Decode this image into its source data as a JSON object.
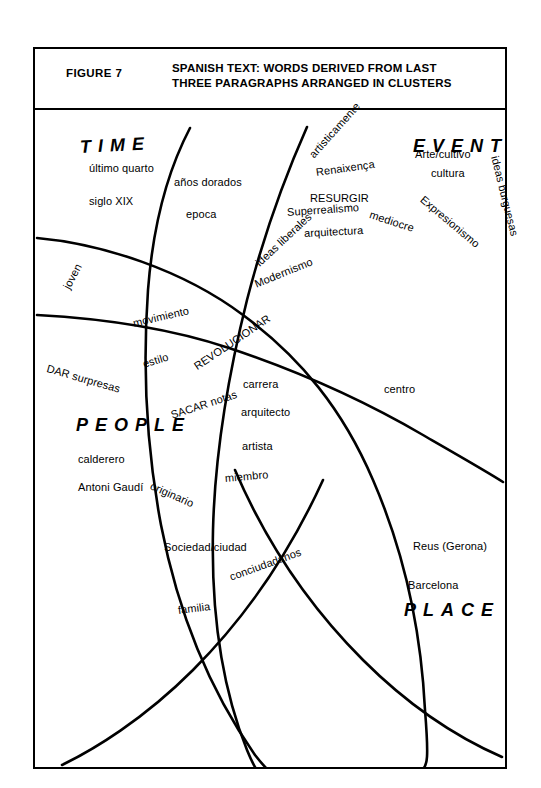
{
  "header": {
    "figure_label": "FIGURE 7",
    "title_line1": "SPANISH TEXT: WORDS DERIVED FROM LAST",
    "title_line2": "THREE PARAGRAPHS ARRANGED IN CLUSTERS",
    "title": "SPANISH TEXT: WORDS DERIVED FROM LAST\nTHREE PARAGRAPHS ARRANGED IN CLUSTERS"
  },
  "colors": {
    "ink": "#000000",
    "paper": "#ffffff"
  },
  "chart_data": {
    "type": "diagram",
    "title": "SPANISH TEXT: WORDS DERIVED FROM LAST THREE PARAGRAPHS ARRANGED IN CLUSTERS",
    "diagram_kind": "overlapping-cluster-venn",
    "cluster_names": [
      "TIME",
      "EVENT",
      "PEOPLE",
      "PLACE"
    ],
    "clusters": [
      {
        "name": "TIME",
        "words": [
          "último quarto",
          "siglo XIX",
          "años dorados",
          "epoca",
          "joven"
        ]
      },
      {
        "name": "EVENT",
        "words": [
          "artisticamente",
          "Renaixença",
          "Arte/cultivo",
          "cultura",
          "RESURGIR",
          "Superrealismo",
          "arquitectura",
          "Expresionismo",
          "mediocre",
          "ideas burguesas",
          "ideas liberales",
          "Modernismo"
        ]
      },
      {
        "name": "PEOPLE",
        "words": [
          "DAR surpresas",
          "calderero",
          "Antoni Gaudí",
          "movimiento",
          "estilo",
          "originario",
          "artista",
          "miembro"
        ]
      },
      {
        "name": "PLACE",
        "words": [
          "Sociedad/ciudad",
          "conciudadanos",
          "familia",
          "Reus (Gerona)",
          "Barcelona",
          "centro"
        ]
      },
      {
        "name": "overlap-center",
        "words": [
          "REVOLUCIONAR",
          "SACAR notas",
          "carrera",
          "arquitecto"
        ]
      }
    ]
  },
  "cluster_labels": [
    {
      "text": "TIME",
      "x": 47,
      "y": 27,
      "rot": -3,
      "size": 18,
      "spacing": 7
    },
    {
      "text": "EVENT",
      "x": 380,
      "y": 26,
      "rot": 0,
      "size": 18,
      "spacing": 7
    },
    {
      "text": "PEOPLE",
      "x": 43,
      "y": 305,
      "rot": 0,
      "size": 18,
      "spacing": 7
    },
    {
      "text": "PLACE",
      "x": 371,
      "y": 490,
      "rot": 0,
      "size": 18,
      "spacing": 7
    }
  ],
  "words": [
    {
      "text": "último quarto",
      "x": 56,
      "y": 52,
      "rot": 0
    },
    {
      "text": "siglo XIX",
      "x": 56,
      "y": 85,
      "rot": 0
    },
    {
      "text": "años dorados",
      "x": 141,
      "y": 66,
      "rot": 0
    },
    {
      "text": "epoca",
      "x": 153,
      "y": 98,
      "rot": 0
    },
    {
      "text": "joven",
      "x": 33,
      "y": 172,
      "rot": -62
    },
    {
      "text": "artisticamente",
      "x": 278,
      "y": 40,
      "rot": -48
    },
    {
      "text": "Renaixença",
      "x": 283,
      "y": 56,
      "rot": -8
    },
    {
      "text": "Arte/cultivo",
      "x": 382,
      "y": 38,
      "rot": 0
    },
    {
      "text": "cultura",
      "x": 398,
      "y": 57,
      "rot": 0
    },
    {
      "text": "RESURGIR",
      "x": 277,
      "y": 82,
      "rot": 0
    },
    {
      "text": "Superrealismo",
      "x": 254,
      "y": 96,
      "rot": -4
    },
    {
      "text": "arquitectura",
      "x": 271,
      "y": 117,
      "rot": -3
    },
    {
      "text": "Expresionismo",
      "x": 389,
      "y": 82,
      "rot": 40
    },
    {
      "text": "mediocre",
      "x": 337,
      "y": 98,
      "rot": 18
    },
    {
      "text": "ideas burguesas",
      "x": 462,
      "y": 40,
      "rot": 76
    },
    {
      "text": "ideas liberales",
      "x": 224,
      "y": 148,
      "rot": -43
    },
    {
      "text": "Modernismo",
      "x": 222,
      "y": 168,
      "rot": -22
    },
    {
      "text": "movimiento",
      "x": 100,
      "y": 207,
      "rot": -13
    },
    {
      "text": "estilo",
      "x": 110,
      "y": 248,
      "rot": -17
    },
    {
      "text": "DAR surpresas",
      "x": 14,
      "y": 252,
      "rot": 16
    },
    {
      "text": "REVOLUCIONAR",
      "x": 162,
      "y": 251,
      "rot": -34
    },
    {
      "text": "carrera",
      "x": 210,
      "y": 268,
      "rot": 0
    },
    {
      "text": "SACAR notas",
      "x": 138,
      "y": 299,
      "rot": -18
    },
    {
      "text": "arquitecto",
      "x": 208,
      "y": 296,
      "rot": 0
    },
    {
      "text": "artista",
      "x": 209,
      "y": 330,
      "rot": 0
    },
    {
      "text": "miembro",
      "x": 192,
      "y": 362,
      "rot": -5
    },
    {
      "text": "calderero",
      "x": 45,
      "y": 343,
      "rot": 0
    },
    {
      "text": "Antoni Gaudí",
      "x": 45,
      "y": 371,
      "rot": 0
    },
    {
      "text": "originario",
      "x": 118,
      "y": 369,
      "rot": 24
    },
    {
      "text": "centro",
      "x": 351,
      "y": 273,
      "rot": 0
    },
    {
      "text": "Sociedad/ciudad",
      "x": 131,
      "y": 431,
      "rot": 0
    },
    {
      "text": "conciudadanos",
      "x": 197,
      "y": 461,
      "rot": -20
    },
    {
      "text": "familia",
      "x": 145,
      "y": 494,
      "rot": -7
    },
    {
      "text": "Reus (Gerona)",
      "x": 380,
      "y": 430,
      "rot": 0
    },
    {
      "text": "Barcelona",
      "x": 375,
      "y": 469,
      "rot": 0
    }
  ],
  "curves": [
    {
      "name": "time-people-boundary",
      "d": "M 4,128 C 70,134 150,160 210,205 C 268,248 310,300 340,370 C 372,444 388,520 392,600 C 396,650 394,655 390,659"
    },
    {
      "name": "event-place-boundary",
      "d": "M 4,205 C 60,208 130,216 196,238 C 262,260 330,290 390,325 C 430,348 458,364 470,372"
    },
    {
      "name": "left-descending-arc",
      "d": "M 157,18 C 135,60 120,115 115,180 C 110,250 112,330 128,415 C 146,508 180,585 222,645 C 240,668 248,672 252,659"
    },
    {
      "name": "right-descending-arc",
      "d": "M 274,17 C 254,62 232,120 214,190 C 196,262 182,340 180,420 C 178,505 190,580 214,640 C 225,667 232,672 236,659"
    },
    {
      "name": "lower-left-sweep",
      "d": "M 29,655 C 60,640 110,610 160,560 C 215,505 258,440 290,370"
    },
    {
      "name": "lower-right-sweep",
      "d": "M 469,647 C 430,630 380,600 330,550 C 275,495 232,430 202,360"
    }
  ]
}
